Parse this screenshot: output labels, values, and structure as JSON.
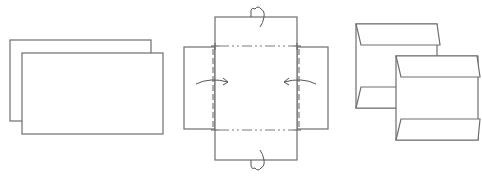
{
  "diagram": {
    "title": "",
    "stroke_color": "#6e6e6e",
    "background": "#ffffff",
    "steps": [
      {
        "id": "step-1",
        "label": "",
        "content": "two overlapping rectangular sheets"
      },
      {
        "id": "step-2",
        "label": "",
        "content": "cross-shaped unfolded sheet with side flaps folded inward (arrows) and top/bottom flaps folded behind (loop arrows), dash-dot valley fold lines"
      },
      {
        "id": "step-3",
        "label": "",
        "content": "two folded pieces with angled top and bottom flaps"
      }
    ],
    "fold_symbols": [
      "valley-fold-arrow-right",
      "valley-fold-arrow-left",
      "mountain-fold-loop-top",
      "mountain-fold-loop-bottom"
    ]
  }
}
